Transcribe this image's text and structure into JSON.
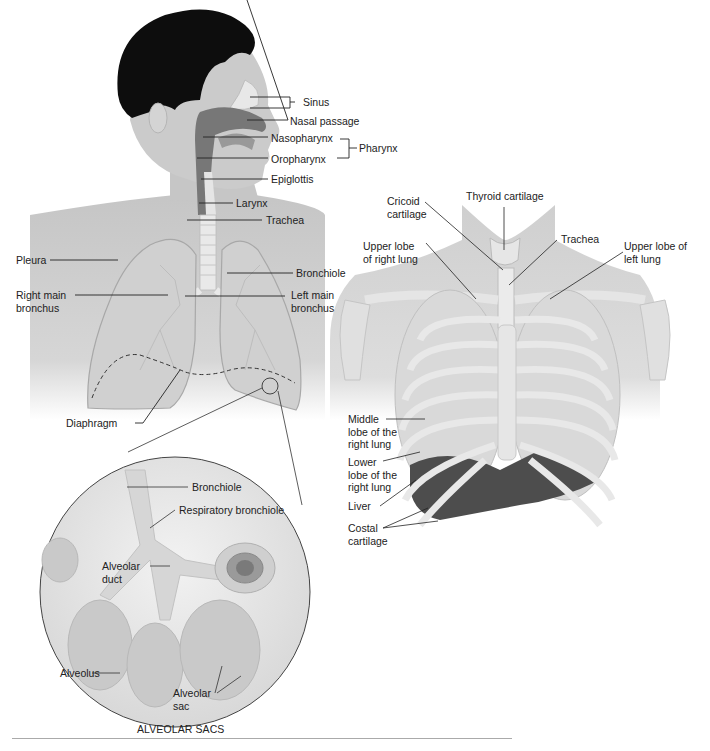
{
  "figure": {
    "caption": "ALVEOLAR SACS",
    "colors": {
      "skin": "#c9c9c9",
      "hair": "#0d0d0d",
      "airway": "#7a7a7a",
      "lung_fill": "#d2d2d2",
      "bone": "#e4e4e4",
      "liver": "#4a4a4a",
      "line": "#333333"
    }
  },
  "head_labels": {
    "sinus": "Sinus",
    "nasal_passage": "Nasal passage",
    "nasopharynx": "Nasopharynx",
    "oropharynx": "Oropharynx",
    "pharynx": "Pharynx",
    "epiglottis": "Epiglottis",
    "larynx": "Larynx",
    "trachea": "Trachea"
  },
  "lung_labels": {
    "pleura": "Pleura",
    "bronchiole": "Bronchiole",
    "right_main_bronchus": "Right main\nbronchus",
    "left_main_bronchus": "Left main\nbronchus",
    "diaphragm": "Diaphragm"
  },
  "chest_labels": {
    "cricoid_cartilage": "Cricoid\ncartilage",
    "thyroid_cartilage": "Thyroid cartilage",
    "trachea": "Trachea",
    "upper_lobe_right": "Upper lobe\nof right lung",
    "upper_lobe_left": "Upper lobe of\nleft lung",
    "middle_lobe_right": "Middle\nlobe of the\nright lung",
    "lower_lobe_right": "Lower\nlobe of the\nright lung",
    "liver": "Liver",
    "costal_cartilage": "Costal\ncartilage"
  },
  "alveoli_labels": {
    "bronchiole": "Bronchiole",
    "respiratory_bronchiole": "Respiratory bronchiole",
    "alveolar_duct": "Alveolar\nduct",
    "alveolus": "Alveolus",
    "alveolar_sac": "Alveolar\nsac"
  }
}
